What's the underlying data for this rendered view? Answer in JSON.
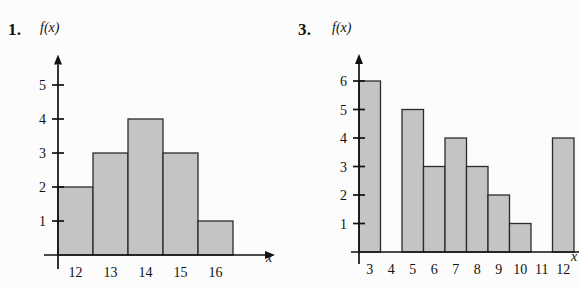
{
  "page": {
    "background": "#fcfcfc",
    "ink": "#111111",
    "bar_fill": "#c4c4c4",
    "bar_stroke": "#2b2b2b"
  },
  "figures": [
    {
      "number_label": "1.",
      "y_axis_title": "f(x)",
      "x_axis_title": "x"
    },
    {
      "number_label": "3.",
      "y_axis_title": "f(x)",
      "x_axis_title": "x"
    }
  ],
  "chart_data": [
    {
      "type": "bar",
      "title": "1.",
      "xlabel": "x",
      "ylabel": "f(x)",
      "categories": [
        "12",
        "13",
        "14",
        "15",
        "16"
      ],
      "values": [
        2,
        3,
        4,
        3,
        1
      ],
      "x_tick_labels": [
        "12",
        "13",
        "14",
        "15",
        "16"
      ],
      "y_tick_labels": [
        "1",
        "2",
        "3",
        "4",
        "5"
      ],
      "y_ticks": [
        1,
        2,
        3,
        4,
        5
      ],
      "ylim": [
        0,
        5.6
      ],
      "grid": false,
      "legend": null,
      "bar_gap": 0,
      "notes": "Histogram with adjacent (touching) bars; axes drawn as arrows."
    },
    {
      "type": "bar",
      "title": "3.",
      "xlabel": "x",
      "ylabel": "f(x)",
      "categories": [
        "3",
        "4",
        "5",
        "6",
        "7",
        "8",
        "9",
        "10",
        "11",
        "12"
      ],
      "values": [
        6,
        0,
        5,
        3,
        4,
        3,
        2,
        1,
        0,
        4
      ],
      "x_tick_labels": [
        "3",
        "4",
        "5",
        "6",
        "7",
        "8",
        "9",
        "10",
        "11",
        "12"
      ],
      "y_tick_labels": [
        "1",
        "2",
        "3",
        "4",
        "5",
        "6"
      ],
      "y_ticks": [
        1,
        2,
        3,
        4,
        5,
        6
      ],
      "ylim": [
        0,
        6.6
      ],
      "grid": false,
      "legend": null,
      "bar_gap": 0,
      "notes": "Histogram with adjacent bars; categories 4 and 11 have zero frequency (blank columns)."
    }
  ]
}
